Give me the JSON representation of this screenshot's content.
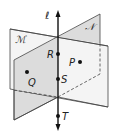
{
  "figure": {
    "line_label": "ℓ",
    "planes": [
      {
        "name": "M",
        "label": "ℳ",
        "fill": "#f4f4f4"
      },
      {
        "name": "N",
        "label": "𝒩",
        "fill": "#dcdcdc"
      }
    ],
    "points": [
      {
        "name": "R",
        "label": "R"
      },
      {
        "name": "S",
        "label": "S"
      },
      {
        "name": "T",
        "label": "T"
      },
      {
        "name": "P",
        "label": "P"
      },
      {
        "name": "Q",
        "label": "Q"
      }
    ],
    "colors": {
      "stroke": "#222222",
      "plane_m": "#f4f4f4",
      "plane_n": "#dcdcdc"
    }
  }
}
